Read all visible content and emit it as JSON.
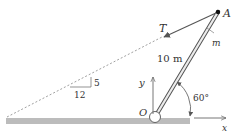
{
  "figure": {
    "labels": {
      "point_a": "A",
      "point_o": "O",
      "tension": "T",
      "mass": "m",
      "length": "10 m",
      "angle": "60°",
      "axis_x": "x",
      "axis_y": "y",
      "slope_run": "12",
      "slope_rise": "5"
    },
    "colors": {
      "ground": "#b8b8b8",
      "line": "#444444",
      "pole_fill": "#e8e8e8"
    }
  }
}
